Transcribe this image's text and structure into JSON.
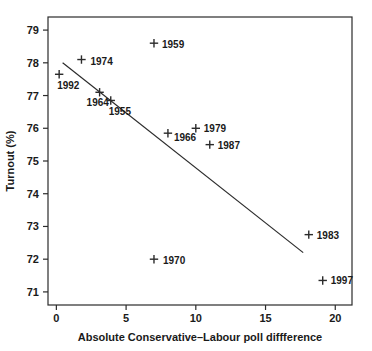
{
  "chart_data": {
    "type": "scatter",
    "title": "",
    "xlabel": "Absolute Conservative–Labour poll diffference",
    "ylabel": "Turnout (%)",
    "xlim": [
      -0.6,
      21.2
    ],
    "ylim": [
      70.6,
      79.4
    ],
    "xticks": [
      0,
      5,
      10,
      15,
      20
    ],
    "xtick_labels": [
      "0",
      "5",
      "10",
      "15",
      "20"
    ],
    "yticks": [
      71,
      72,
      73,
      74,
      75,
      76,
      77,
      78,
      79
    ],
    "ytick_labels": [
      "71",
      "72",
      "73",
      "74",
      "75",
      "76",
      "77",
      "78",
      "79"
    ],
    "grid": false,
    "legend": "none",
    "marker": "plus",
    "points": [
      {
        "label": "1992",
        "x": 0.2,
        "y": 77.65,
        "label_dx": -2,
        "label_dy": 15
      },
      {
        "label": "1974",
        "x": 1.8,
        "y": 78.1,
        "label_dx": 9,
        "label_dy": 5
      },
      {
        "label": "1964",
        "x": 3.1,
        "y": 77.1,
        "label_dx": -13,
        "label_dy": 14
      },
      {
        "label": "1955",
        "x": 3.9,
        "y": 76.85,
        "label_dx": -2,
        "label_dy": 15
      },
      {
        "label": "1959",
        "x": 7.0,
        "y": 78.6,
        "label_dx": 8,
        "label_dy": 5
      },
      {
        "label": "1970",
        "x": 7.0,
        "y": 72.0,
        "label_dx": 9,
        "label_dy": 5
      },
      {
        "label": "1966",
        "x": 8.0,
        "y": 75.85,
        "label_dx": 6,
        "label_dy": 8
      },
      {
        "label": "1979",
        "x": 10.0,
        "y": 76.0,
        "label_dx": 8,
        "label_dy": 4
      },
      {
        "label": "1987",
        "x": 11.0,
        "y": 75.5,
        "label_dx": 8,
        "label_dy": 4
      },
      {
        "label": "1983",
        "x": 18.1,
        "y": 72.75,
        "label_dx": 8,
        "label_dy": 4
      },
      {
        "label": "1997",
        "x": 19.1,
        "y": 71.35,
        "label_dx": 8,
        "label_dy": 4
      }
    ],
    "fit_line": {
      "name": "least-squares regression line",
      "x_start": 0.45,
      "y_start": 78.0,
      "x_end": 17.7,
      "y_end": 72.2
    }
  }
}
